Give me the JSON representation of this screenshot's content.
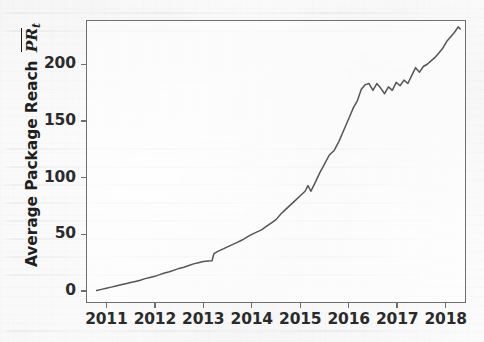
{
  "figure": {
    "name": "average-package-reach-timeseries",
    "background_color": "#fcfcfc",
    "plot_background_color": "#ffffff",
    "frame_color": "#6e6e6e",
    "line_color": "#555555"
  },
  "chart_data": {
    "type": "line",
    "title": "",
    "xlabel": "",
    "ylabel": "Average Package Reach PR_t",
    "ylabel_parts": {
      "prefix": "Average Package Reach ",
      "symbol": "PR",
      "subscript": "t",
      "overline": true
    },
    "grid": false,
    "legend": null,
    "xlim": [
      2010.58,
      2018.42
    ],
    "ylim": [
      -10.5,
      239.0
    ],
    "xticks": [
      2011,
      2012,
      2013,
      2014,
      2015,
      2016,
      2017,
      2018
    ],
    "xticklabels": [
      "2011",
      "2012",
      "2013",
      "2014",
      "2015",
      "2016",
      "2017",
      "2018"
    ],
    "yticks": [
      0,
      50,
      100,
      150,
      200
    ],
    "yticklabels": [
      "0",
      "50",
      "100",
      "150",
      "200"
    ],
    "series": [
      {
        "name": "Average Package Reach",
        "color": "#555555",
        "linewidth": 1.5,
        "x": [
          2010.8,
          2010.9,
          2011.0,
          2011.1,
          2011.2,
          2011.3,
          2011.4,
          2011.5,
          2011.6,
          2011.7,
          2011.8,
          2011.9,
          2012.0,
          2012.1,
          2012.2,
          2012.3,
          2012.4,
          2012.5,
          2012.6,
          2012.7,
          2012.8,
          2012.9,
          2013.0,
          2013.1,
          2013.18,
          2013.22,
          2013.3,
          2013.4,
          2013.5,
          2013.6,
          2013.7,
          2013.8,
          2013.9,
          2014.0,
          2014.1,
          2014.2,
          2014.3,
          2014.4,
          2014.5,
          2014.6,
          2014.7,
          2014.8,
          2014.9,
          2015.0,
          2015.1,
          2015.16,
          2015.22,
          2015.3,
          2015.4,
          2015.5,
          2015.6,
          2015.7,
          2015.8,
          2015.9,
          2016.0,
          2016.1,
          2016.18,
          2016.26,
          2016.34,
          2016.42,
          2016.5,
          2016.58,
          2016.66,
          2016.74,
          2016.82,
          2016.9,
          2016.98,
          2017.06,
          2017.14,
          2017.22,
          2017.3,
          2017.38,
          2017.46,
          2017.54,
          2017.62,
          2017.7,
          2017.78,
          2017.86,
          2017.94,
          2018.02,
          2018.1,
          2018.18,
          2018.26,
          2018.3
        ],
        "y": [
          0.5,
          1.5,
          2.5,
          3.5,
          4.5,
          5.5,
          6.5,
          7.5,
          8.5,
          9.5,
          11.0,
          12.0,
          13.0,
          14.5,
          16.0,
          17.0,
          18.5,
          20.0,
          21.0,
          22.5,
          24.0,
          25.0,
          26.0,
          26.5,
          26.8,
          33.0,
          35.0,
          37.0,
          39.0,
          41.0,
          43.0,
          45.0,
          47.5,
          50.0,
          52.0,
          54.0,
          57.0,
          60.0,
          63.0,
          68.0,
          72.0,
          76.0,
          80.0,
          84.0,
          88.0,
          93.0,
          88.0,
          95.0,
          104.0,
          112.0,
          120.0,
          124.0,
          132.0,
          142.0,
          152.0,
          162.0,
          168.0,
          178.0,
          182.0,
          183.0,
          177.0,
          183.0,
          179.0,
          174.0,
          180.0,
          177.0,
          184.0,
          181.0,
          186.0,
          183.0,
          190.0,
          197.0,
          193.0,
          198.0,
          200.0,
          203.0,
          206.0,
          210.0,
          214.0,
          220.0,
          224.0,
          228.0,
          233.0,
          231.0
        ]
      }
    ]
  }
}
